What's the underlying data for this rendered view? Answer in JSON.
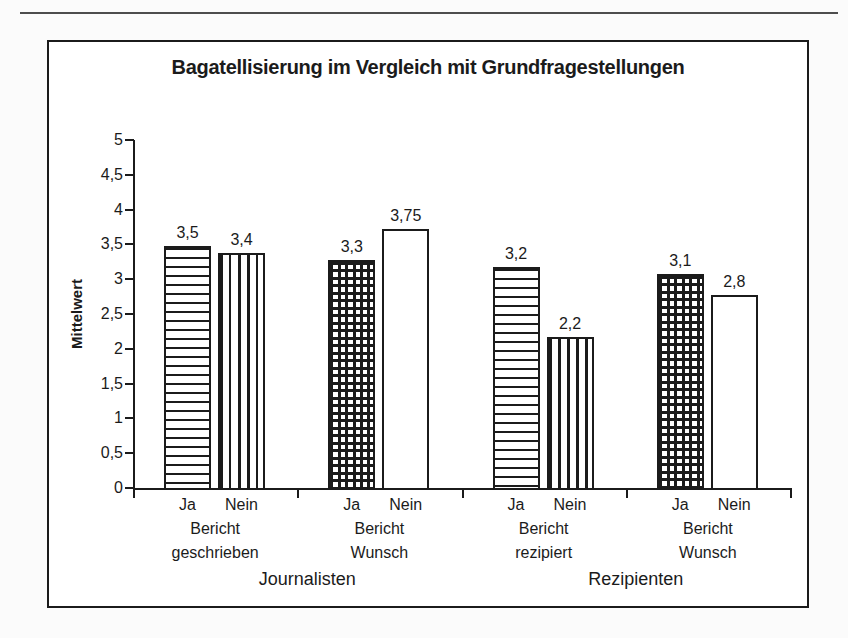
{
  "page": {
    "top_rule_color": "#4d4d4d"
  },
  "colors": {
    "ink": "#1b1b1b",
    "chart_background": "#ffffff",
    "page_background": "#fbfbfb"
  },
  "chart_data": {
    "type": "bar",
    "title": "Bagatellisierung im Vergleich mit Grundfragestellungen",
    "xlabel": "",
    "ylabel": "Mittelwert",
    "ylim": [
      0,
      5
    ],
    "ytick_step": 0.5,
    "ytick_labels": [
      "0",
      "0,5",
      "1",
      "1,5",
      "2",
      "2,5",
      "3",
      "3,5",
      "4",
      "4,5",
      "5"
    ],
    "grid": false,
    "legend_position": "none",
    "bar_category_labels": [
      "Ja",
      "Nein"
    ],
    "groups": [
      {
        "sublabel_lines": [
          "Bericht",
          "geschrieben"
        ],
        "bars": [
          {
            "label": "Ja",
            "value": 3.5,
            "display": "3,5",
            "pattern": "hstripe"
          },
          {
            "label": "Nein",
            "value": 3.4,
            "display": "3,4",
            "pattern": "vstripe"
          }
        ]
      },
      {
        "sublabel_lines": [
          "Bericht",
          "Wunsch"
        ],
        "bars": [
          {
            "label": "Ja",
            "value": 3.3,
            "display": "3,3",
            "pattern": "grid"
          },
          {
            "label": "Nein",
            "value": 3.75,
            "display": "3,75",
            "pattern": "plain"
          }
        ]
      },
      {
        "sublabel_lines": [
          "Bericht",
          "rezipiert"
        ],
        "bars": [
          {
            "label": "Ja",
            "value": 3.2,
            "display": "3,2",
            "pattern": "hstripe"
          },
          {
            "label": "Nein",
            "value": 2.2,
            "display": "2,2",
            "pattern": "vstripe"
          }
        ]
      },
      {
        "sublabel_lines": [
          "Bericht",
          "Wunsch"
        ],
        "bars": [
          {
            "label": "Ja",
            "value": 3.1,
            "display": "3,1",
            "pattern": "grid"
          },
          {
            "label": "Nein",
            "value": 2.8,
            "display": "2,8",
            "pattern": "plain"
          }
        ]
      }
    ],
    "sections": [
      {
        "label": "Journalisten",
        "group_indices": [
          0,
          1
        ]
      },
      {
        "label": "Rezipienten",
        "group_indices": [
          2,
          3
        ]
      }
    ]
  }
}
